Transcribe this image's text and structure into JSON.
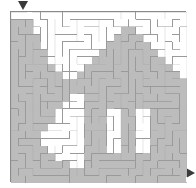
{
  "puzzle": {
    "type": "picture-maze",
    "title": "House Maze",
    "subject": "cottage-house-silhouette",
    "grid": {
      "cols": 24,
      "rows": 23
    },
    "geometry": {
      "canvas_w": 196,
      "canvas_h": 188,
      "maze_x": 10,
      "maze_y": 11,
      "maze_w": 176,
      "maze_h": 171
    },
    "colors": {
      "background": "#ffffff",
      "shaded_cell": "#bcbcbc",
      "open_cell": "#ffffff",
      "wall": "#9a9a9a",
      "border": "#8a8a8a",
      "marker": "#3a3a3a"
    },
    "entry": {
      "name": "entry-arrow",
      "glyph": "▼",
      "direction": "down",
      "x": 18,
      "y": 1,
      "size": 5
    },
    "exit": {
      "name": "exit-arrow",
      "glyph": "▶",
      "direction": "right",
      "x": 186,
      "y": 168,
      "size": 5
    },
    "shading": {
      "note": "1 = shaded (picture), 0 = open. 24 columns x 23 rows.",
      "rows": [
        "000000000000000000000000",
        "111000000000000000000000",
        "111000000000000110000000",
        "111100000000001111000000",
        "111100000000011111100000",
        "111110000000111111110000",
        "111110000001111111111000",
        "111111000011111111111100",
        "111111100111111111111110",
        "111111111111111111111111",
        "111111111111111111111111",
        "111111110011111111111111",
        "111111100011111111111111",
        "111111000011100110011111",
        "111111000011100110011111",
        "111110000011100110011111",
        "111100000011100110011111",
        "111100000011100110011111",
        "111110000011100110011111",
        "111111000011111111111111",
        "111111110011111111111111",
        "111111111111111111111111",
        "111111111111111111111111"
      ]
    },
    "walls": {
      "note": "Procedurally generated maze corridors drawn as thin gray strokes.",
      "seed": 20240817,
      "stroke_width": 1
    },
    "labels": {
      "entry_label": "Start",
      "exit_label": "Finish"
    }
  }
}
